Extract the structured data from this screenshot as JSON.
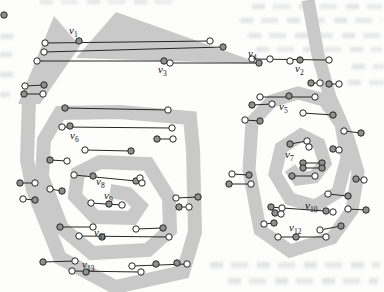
{
  "figure": {
    "labels": [
      {
        "t": "v",
        "s": "1",
        "x": 69,
        "y": 34
      },
      {
        "t": "v",
        "s": "2",
        "x": 295,
        "y": 72
      },
      {
        "t": "v",
        "s": "3",
        "x": 158,
        "y": 73
      },
      {
        "t": "v",
        "s": "4",
        "x": 248,
        "y": 57
      },
      {
        "t": "v",
        "s": "5",
        "x": 279,
        "y": 110
      },
      {
        "t": "v",
        "s": "6",
        "x": 70,
        "y": 139
      },
      {
        "t": "v",
        "s": "7",
        "x": 285,
        "y": 158
      },
      {
        "t": "v",
        "s": "8",
        "x": 96,
        "y": 185
      },
      {
        "t": "v",
        "s": "9",
        "x": 104,
        "y": 199
      },
      {
        "t": "v",
        "s": "10",
        "x": 305,
        "y": 209
      },
      {
        "t": "v",
        "s": "11",
        "x": 94,
        "y": 236
      },
      {
        "t": "v",
        "s": "12",
        "x": 289,
        "y": 231
      },
      {
        "t": "v",
        "s": "13",
        "x": 82,
        "y": 268
      }
    ]
  },
  "diagram": {
    "width": 384,
    "height": 292,
    "colors": {
      "band": "#c9c9c9",
      "line": "#262626",
      "filled_endpoint": "#8f8f8f",
      "open_endpoint": "#ffffff",
      "label": "#111111"
    },
    "band_polygons": [
      {
        "id": "left-peak-band",
        "points": "18,104 54,16 80,46 40,104"
      },
      {
        "id": "left-top-wedge",
        "points": "76,58 116,12 262,64"
      }
    ],
    "spirals": [
      {
        "id": "left-spiral",
        "stroke_width": 14,
        "points": "29,100 27,160 33,190 60,258 115,287 183,272 195,232 193,150 190,118 120,112 60,113 44,140 42,177 62,228 92,253 148,250 170,230 169,198 148,164 100,162 78,173 75,196 95,217 132,218 140,206 128,194 110,191"
      },
      {
        "id": "right-spiral",
        "stroke_width": 13,
        "points": "308,0 318,55 330,97 348,138 358,172 352,210 332,238 290,251 260,230 249,170 252,122 272,101 298,93 324,100 341,124 347,158 338,192 315,206 290,199 275,174 281,148 301,135 319,144 325,163 314,177 298,179 290,168"
      }
    ],
    "segments": [
      [
        45,
        43,
        210,
        41
      ],
      [
        44,
        52,
        223,
        47
      ],
      [
        37,
        61,
        164,
        61
      ],
      [
        170,
        63,
        259,
        63
      ],
      [
        252,
        59,
        329,
        60
      ],
      [
        25,
        86,
        44,
        85
      ],
      [
        24,
        94,
        43,
        94
      ],
      [
        65,
        108,
        168,
        110
      ],
      [
        62,
        127,
        172,
        128
      ],
      [
        50,
        160,
        67,
        161
      ],
      [
        85,
        150,
        131,
        151
      ],
      [
        20,
        183,
        35,
        183
      ],
      [
        23,
        199,
        35,
        200
      ],
      [
        50,
        189,
        62,
        191
      ],
      [
        74,
        175,
        136,
        181
      ],
      [
        91,
        203,
        122,
        205
      ],
      [
        60,
        227,
        93,
        227
      ],
      [
        79,
        236,
        169,
        237
      ],
      [
        136,
        229,
        163,
        228
      ],
      [
        43,
        262,
        75,
        261
      ],
      [
        72,
        271,
        141,
        272
      ],
      [
        132,
        266,
        187,
        264
      ],
      [
        176,
        198,
        198,
        197
      ],
      [
        179,
        207,
        189,
        207
      ],
      [
        157,
        139,
        173,
        139
      ],
      [
        252,
        105,
        272,
        104
      ],
      [
        245,
        120,
        260,
        121
      ],
      [
        232,
        174,
        249,
        175
      ],
      [
        229,
        184,
        251,
        184
      ],
      [
        264,
        224,
        274,
        223
      ],
      [
        271,
        207,
        282,
        208
      ],
      [
        275,
        213,
        281,
        214
      ],
      [
        282,
        208,
        326,
        211
      ],
      [
        348,
        209,
        366,
        210
      ],
      [
        278,
        237,
        326,
        237
      ],
      [
        320,
        230,
        341,
        226
      ],
      [
        328,
        194,
        348,
        196
      ],
      [
        356,
        179,
        364,
        180
      ],
      [
        344,
        131,
        361,
        133
      ],
      [
        333,
        149,
        339,
        150
      ],
      [
        260,
        97,
        315,
        97
      ],
      [
        303,
        113,
        333,
        115
      ],
      [
        311,
        83,
        320,
        83
      ],
      [
        329,
        84,
        339,
        84
      ],
      [
        303,
        163,
        322,
        163
      ],
      [
        303,
        168,
        322,
        168
      ],
      [
        290,
        144,
        307,
        141
      ],
      [
        292,
        176,
        315,
        176
      ]
    ],
    "endpoints": [
      [
        45,
        43,
        "w"
      ],
      [
        79,
        41,
        "g"
      ],
      [
        210,
        41,
        "w"
      ],
      [
        44,
        52,
        "w"
      ],
      [
        223,
        47,
        "g"
      ],
      [
        37,
        61,
        "w"
      ],
      [
        164,
        61,
        "g"
      ],
      [
        170,
        63,
        "w"
      ],
      [
        259,
        63,
        "g"
      ],
      [
        252,
        59,
        "w"
      ],
      [
        270,
        59,
        "w"
      ],
      [
        290,
        61,
        "w"
      ],
      [
        300,
        60,
        "g"
      ],
      [
        329,
        60,
        "w"
      ],
      [
        25,
        86,
        "w"
      ],
      [
        44,
        85,
        "g"
      ],
      [
        24,
        94,
        "g"
      ],
      [
        43,
        94,
        "w"
      ],
      [
        65,
        108,
        "g"
      ],
      [
        168,
        110,
        "w"
      ],
      [
        62,
        127,
        "w"
      ],
      [
        70,
        126,
        "g"
      ],
      [
        172,
        128,
        "w"
      ],
      [
        50,
        160,
        "g"
      ],
      [
        67,
        161,
        "w"
      ],
      [
        85,
        150,
        "w"
      ],
      [
        131,
        151,
        "g"
      ],
      [
        20,
        183,
        "g"
      ],
      [
        35,
        183,
        "w"
      ],
      [
        23,
        199,
        "w"
      ],
      [
        35,
        200,
        "g"
      ],
      [
        50,
        189,
        "w"
      ],
      [
        62,
        191,
        "g"
      ],
      [
        74,
        175,
        "w"
      ],
      [
        93,
        176,
        "g"
      ],
      [
        136,
        181,
        "g"
      ],
      [
        140,
        178,
        "w"
      ],
      [
        142,
        183,
        "w"
      ],
      [
        91,
        203,
        "w"
      ],
      [
        109,
        204,
        "g"
      ],
      [
        122,
        205,
        "w"
      ],
      [
        60,
        227,
        "g"
      ],
      [
        93,
        227,
        "w"
      ],
      [
        79,
        236,
        "w"
      ],
      [
        102,
        237,
        "g"
      ],
      [
        169,
        237,
        "w"
      ],
      [
        136,
        229,
        "w"
      ],
      [
        163,
        228,
        "g"
      ],
      [
        43,
        262,
        "g"
      ],
      [
        75,
        261,
        "w"
      ],
      [
        72,
        271,
        "w"
      ],
      [
        86,
        272,
        "g"
      ],
      [
        141,
        272,
        "w"
      ],
      [
        132,
        266,
        "w"
      ],
      [
        156,
        264,
        "g"
      ],
      [
        177,
        263,
        "g"
      ],
      [
        187,
        264,
        "w"
      ],
      [
        176,
        198,
        "w"
      ],
      [
        198,
        197,
        "g"
      ],
      [
        179,
        207,
        "g"
      ],
      [
        189,
        207,
        "w"
      ],
      [
        157,
        139,
        "g"
      ],
      [
        173,
        139,
        "w"
      ],
      [
        252,
        105,
        "g"
      ],
      [
        272,
        104,
        "w"
      ],
      [
        245,
        120,
        "w"
      ],
      [
        260,
        121,
        "g"
      ],
      [
        232,
        174,
        "w"
      ],
      [
        249,
        175,
        "g"
      ],
      [
        229,
        184,
        "g"
      ],
      [
        251,
        184,
        "w"
      ],
      [
        264,
        224,
        "w"
      ],
      [
        274,
        223,
        "g"
      ],
      [
        271,
        207,
        "g"
      ],
      [
        282,
        208,
        "w"
      ],
      [
        275,
        213,
        "g"
      ],
      [
        281,
        214,
        "w"
      ],
      [
        326,
        211,
        "g"
      ],
      [
        333,
        212,
        "w"
      ],
      [
        348,
        209,
        "w"
      ],
      [
        366,
        210,
        "g"
      ],
      [
        278,
        237,
        "w"
      ],
      [
        296,
        237,
        "g"
      ],
      [
        326,
        237,
        "w"
      ],
      [
        320,
        230,
        "w"
      ],
      [
        341,
        226,
        "g"
      ],
      [
        328,
        194,
        "w"
      ],
      [
        348,
        196,
        "g"
      ],
      [
        356,
        179,
        "g"
      ],
      [
        364,
        180,
        "w"
      ],
      [
        344,
        131,
        "w"
      ],
      [
        361,
        133,
        "g"
      ],
      [
        333,
        149,
        "g"
      ],
      [
        339,
        150,
        "w"
      ],
      [
        260,
        97,
        "w"
      ],
      [
        289,
        96,
        "g"
      ],
      [
        315,
        97,
        "w"
      ],
      [
        303,
        113,
        "w"
      ],
      [
        333,
        115,
        "g"
      ],
      [
        311,
        83,
        "g"
      ],
      [
        320,
        83,
        "w"
      ],
      [
        329,
        84,
        "g"
      ],
      [
        339,
        84,
        "w"
      ],
      [
        303,
        163,
        "g"
      ],
      [
        322,
        163,
        "g"
      ],
      [
        303,
        168,
        "g"
      ],
      [
        322,
        168,
        "g"
      ],
      [
        290,
        144,
        "g"
      ],
      [
        307,
        141,
        "w"
      ],
      [
        309,
        147,
        "w"
      ],
      [
        292,
        176,
        "g"
      ],
      [
        315,
        176,
        "w"
      ],
      [
        4,
        15,
        "g"
      ]
    ],
    "endpoint_radius": 3.2
  }
}
